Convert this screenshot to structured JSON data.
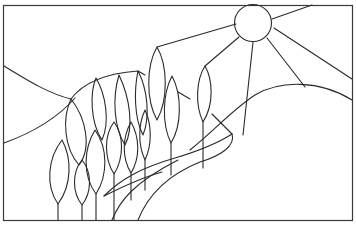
{
  "artwork": {
    "subject": "stained glass pattern line drawing",
    "elements": [
      "sun",
      "sun-rays",
      "hills",
      "poplar-trees",
      "path"
    ],
    "colors": {
      "line": "#2a2a2a",
      "background": "#ffffff"
    }
  }
}
